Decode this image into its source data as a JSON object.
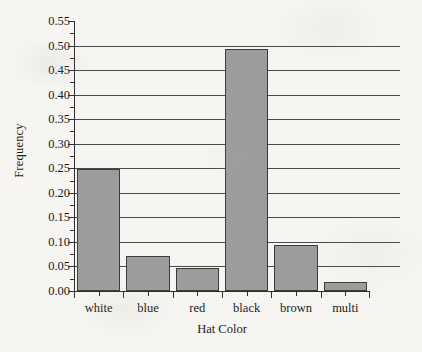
{
  "chart_data": {
    "type": "bar",
    "title": "",
    "xlabel": "Hat Color",
    "ylabel": "Frequency",
    "categories": [
      "white",
      "blue",
      "red",
      "black",
      "brown",
      "multi"
    ],
    "values": [
      0.248,
      0.072,
      0.046,
      0.494,
      0.094,
      0.018
    ],
    "ylim": [
      0.0,
      0.55
    ],
    "ytick_labels": [
      "0.00",
      "0.05",
      "0.10",
      "0.15",
      "0.20",
      "0.25",
      "0.30",
      "0.35",
      "0.40",
      "0.45",
      "0.50",
      "0.55"
    ],
    "ytick_values": [
      0.0,
      0.05,
      0.1,
      0.15,
      0.2,
      0.25,
      0.3,
      0.35,
      0.4,
      0.45,
      0.5,
      0.55
    ],
    "grid": "horizontal",
    "gridline_values": [
      0.05,
      0.1,
      0.15,
      0.2,
      0.25,
      0.3,
      0.35,
      0.4,
      0.45,
      0.5
    ],
    "legend": "none",
    "bar_fill_color": "#9c9c9c",
    "bar_edge_color": "#3c3c3c",
    "axis_color": "#2e2e2e",
    "background_color": "#f6f5f2"
  }
}
